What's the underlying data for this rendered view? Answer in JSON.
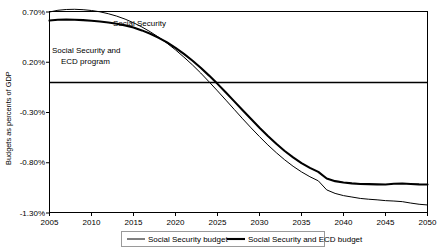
{
  "chart_data": {
    "type": "line",
    "title": "",
    "xlabel": "",
    "ylabel": "Budgets as percents of GDP",
    "xlim": [
      2005,
      2050
    ],
    "ylim": [
      -1.3,
      0.7
    ],
    "grid": false,
    "legend_position": "bottom",
    "zero_line": 0.0,
    "xticks": [
      "2005",
      "2010",
      "2015",
      "2020",
      "2025",
      "2030",
      "2035",
      "2040",
      "2045",
      "2050"
    ],
    "yticks": [
      "0.70%",
      "0.20%",
      "-0.30%",
      "-0.80%",
      "-1.30%"
    ],
    "ytick_values": [
      0.7,
      0.2,
      -0.3,
      -0.8,
      -1.3
    ],
    "annotations": [
      {
        "name": "social-security-annotation",
        "text": "Social Security",
        "x": 2018.5,
        "y": 0.6
      },
      {
        "name": "social-security-ecd-annotation",
        "text": "Social Security and\nECD program",
        "line1": "Social Security and",
        "line2": "ECD program",
        "x": 2006.5,
        "y": 0.33
      }
    ],
    "x": [
      2005,
      2006,
      2007,
      2008,
      2009,
      2010,
      2011,
      2012,
      2013,
      2014,
      2015,
      2016,
      2017,
      2018,
      2019,
      2020,
      2021,
      2022,
      2023,
      2024,
      2025,
      2026,
      2027,
      2028,
      2029,
      2030,
      2031,
      2032,
      2033,
      2034,
      2035,
      2036,
      2037,
      2038,
      2039,
      2040,
      2041,
      2042,
      2043,
      2044,
      2045,
      2046,
      2047,
      2048,
      2049,
      2050
    ],
    "series": [
      {
        "name": "Social Security budget",
        "legend_label": "Social Security budget",
        "line_width": 1.0,
        "color": "#000000",
        "values": [
          0.695,
          0.712,
          0.72,
          0.722,
          0.718,
          0.71,
          0.697,
          0.678,
          0.654,
          0.624,
          0.588,
          0.546,
          0.498,
          0.444,
          0.384,
          0.318,
          0.246,
          0.17,
          0.088,
          0.0,
          -0.09,
          -0.182,
          -0.275,
          -0.368,
          -0.458,
          -0.545,
          -0.628,
          -0.705,
          -0.776,
          -0.84,
          -0.896,
          -0.944,
          -0.985,
          -1.075,
          -1.11,
          -1.132,
          -1.146,
          -1.16,
          -1.168,
          -1.174,
          -1.182,
          -1.186,
          -1.192,
          -1.206,
          -1.218,
          -1.225
        ]
      },
      {
        "name": "Social Security and ECD budget",
        "legend_label": "Social Security and ECD budget",
        "line_width": 2.1,
        "color": "#000000",
        "values": [
          0.61,
          0.618,
          0.62,
          0.618,
          0.614,
          0.608,
          0.6,
          0.59,
          0.578,
          0.562,
          0.54,
          0.512,
          0.478,
          0.438,
          0.392,
          0.338,
          0.278,
          0.212,
          0.14,
          0.062,
          -0.02,
          -0.106,
          -0.194,
          -0.282,
          -0.37,
          -0.456,
          -0.538,
          -0.616,
          -0.688,
          -0.752,
          -0.808,
          -0.856,
          -0.896,
          -0.962,
          -0.988,
          -1.002,
          -1.01,
          -1.016,
          -1.018,
          -1.02,
          -1.022,
          -1.014,
          -1.012,
          -1.016,
          -1.02,
          -1.022
        ]
      }
    ],
    "series_detail_note": "both curves show small year-to-year wiggles after 2033 and a pronounced dip near 2037"
  }
}
